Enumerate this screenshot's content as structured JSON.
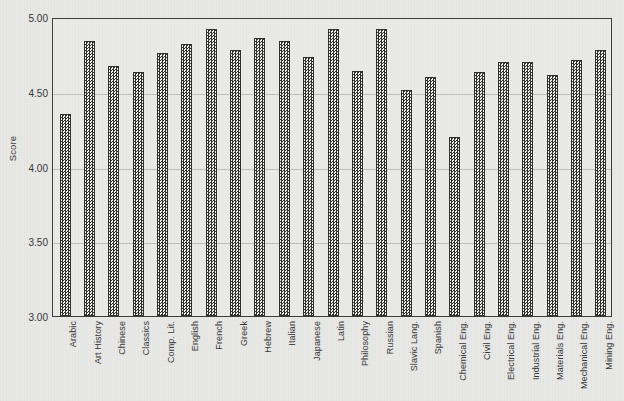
{
  "chart_data": {
    "type": "bar",
    "title": "",
    "subtitle": "",
    "xlabel": "",
    "ylabel": "Score",
    "ylim": [
      3.0,
      5.0
    ],
    "ytick_labels": [
      "5.00",
      "4.50",
      "4.00",
      "3.50",
      "3.00"
    ],
    "ytick_values": [
      5.0,
      4.5,
      4.0,
      3.5,
      3.0
    ],
    "grid": true,
    "legend": false,
    "legend_position": "none",
    "categories": [
      "Arabic",
      "Art History",
      "Chinese",
      "Classics",
      "Comp. Lit.",
      "English",
      "French",
      "Greek",
      "Hebrew",
      "Italian",
      "Japanese",
      "Latin",
      "Philosophy",
      "Russian",
      "Slavic Lang.",
      "Spanish",
      "Chemical Eng.",
      "Civil Eng.",
      "Electrical Eng.",
      "Industrial Eng.",
      "Materials Eng.",
      "Mechanical Eng.",
      "Mining Eng."
    ],
    "values": [
      4.35,
      4.84,
      4.67,
      4.63,
      4.76,
      4.82,
      4.92,
      4.78,
      4.86,
      4.84,
      4.73,
      4.92,
      4.64,
      4.92,
      4.51,
      4.6,
      4.2,
      4.63,
      4.7,
      4.7,
      4.61,
      4.71,
      4.78
    ]
  },
  "style": {
    "background_color": "#e9e9e7",
    "plot_background_color": "#ebebe9",
    "bar_fill_dark": "#2f2f2d",
    "bar_fill_light": "#f2f2f0",
    "bar_border_color": "#2e2e2c",
    "axis_color": "#3b3b39",
    "grid_color": "#82827d",
    "text_color": "#343432"
  }
}
